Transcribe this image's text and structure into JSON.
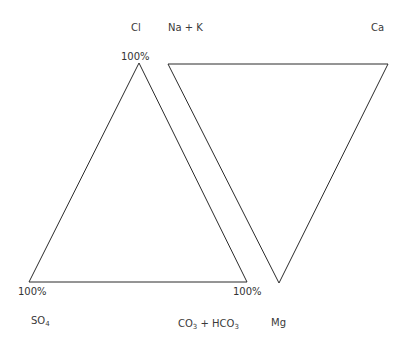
{
  "diagram": {
    "type": "ternary-triangles (Piper diagram components)",
    "anion_triangle": {
      "apex_label": "Cl",
      "bottom_left_label": "SO4",
      "bottom_right_label": "CO3 + HCO3",
      "apex_pct": "100%",
      "bottom_left_pct": "100%",
      "bottom_right_pct": "100%"
    },
    "cation_triangle": {
      "top_left_label": "Na + K",
      "top_right_label": "Ca",
      "bottom_label": "Mg"
    },
    "labels": {
      "cl": "Cl",
      "nak": "Na + K",
      "ca": "Ca",
      "so4_main": "SO",
      "so4_sub": "4",
      "co3_main": "CO",
      "co3_sub": "3",
      "plus_hco": " + HCO",
      "hco3_sub": "3",
      "mg": "Mg",
      "pct_top": "100%",
      "pct_bl": "100%",
      "pct_br": "100%"
    },
    "stroke_color": "#2b2b2b"
  }
}
